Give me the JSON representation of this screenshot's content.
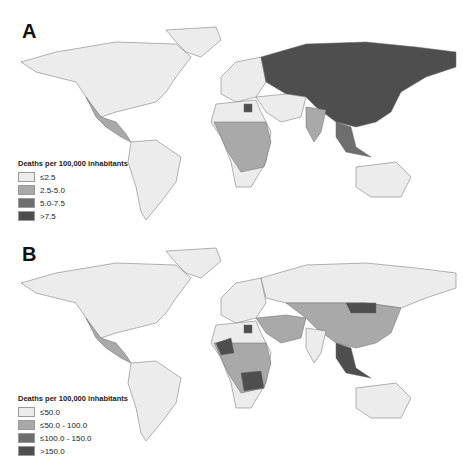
{
  "figure": {
    "panels": [
      {
        "label": "A",
        "legend": {
          "title": "Deaths per 100,000 inhabitants",
          "items": [
            {
              "label": "≤2.5",
              "color": "#ececec"
            },
            {
              "label": "2.5-5.0",
              "color": "#a9a9a9"
            },
            {
              "label": "5.0-7.5",
              "color": "#6e6e6e"
            },
            {
              "label": ">7.5",
              "color": "#4e4e4e"
            }
          ]
        },
        "highlights": {
          "highest": [
            "Russia",
            "Kazakhstan",
            "Mongolia",
            "China",
            "Egypt",
            "Southeast Asia"
          ],
          "middle": [
            "Mexico",
            "Central America",
            "West Africa",
            "Central Africa",
            "East Africa",
            "India"
          ],
          "lowest": [
            "North America",
            "South America",
            "Europe",
            "Australia",
            "Southern Africa",
            "Middle East"
          ]
        }
      },
      {
        "label": "B",
        "legend": {
          "title": "Deaths per 100,000 inhabitants",
          "items": [
            {
              "label": "≤50.0",
              "color": "#ececec"
            },
            {
              "label": "≤50.0 - 100.0",
              "color": "#a9a9a9"
            },
            {
              "label": "≤100.0 - 150.0",
              "color": "#6e6e6e"
            },
            {
              "label": ">150.0",
              "color": "#4e4e4e"
            }
          ]
        },
        "highlights": {
          "highest": [
            "Mongolia",
            "Egypt",
            "Mali",
            "Nigeria",
            "Ethiopia",
            "Angola",
            "Zambia",
            "Mozambique",
            "Myanmar",
            "Indonesia"
          ],
          "middle": [
            "Mexico",
            "Central Asia",
            "China",
            "Central Africa",
            "Madagascar",
            "Middle East"
          ],
          "lowest": [
            "North America",
            "South America",
            "Europe",
            "Russia",
            "India",
            "Australia",
            "Southern Africa"
          ]
        }
      }
    ]
  }
}
